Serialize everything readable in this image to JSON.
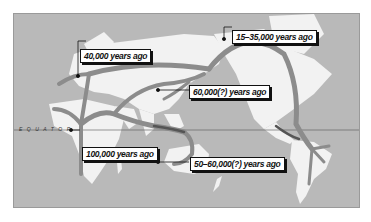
{
  "map": {
    "title": "Human migration routes",
    "equator_label": "EQUATOR",
    "colors": {
      "ocean": "#b9b9b9",
      "land": "#f2f2f2",
      "route": "#8c8c8c",
      "route_dark": "#555555",
      "label_bg": "#ffffff",
      "label_border": "#111111"
    },
    "labels": [
      {
        "id": "europe",
        "text": "40,000 years ago"
      },
      {
        "id": "beringia",
        "text": "15–35,000 years ago"
      },
      {
        "id": "asia",
        "text": "60,000(?) years ago"
      },
      {
        "id": "africa",
        "text": "100,000 years ago"
      },
      {
        "id": "australia",
        "text": "50–60,000(?) years ago"
      }
    ]
  }
}
